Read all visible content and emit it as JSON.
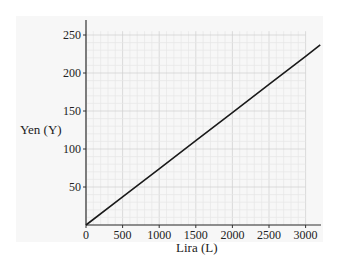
{
  "chart_data": {
    "type": "line",
    "title": "",
    "xlabel": "Lira (L)",
    "ylabel": "Yen (Y)",
    "xlim": [
      0,
      3200
    ],
    "ylim": [
      0,
      270
    ],
    "x_ticks": [
      0,
      500,
      1000,
      1500,
      2000,
      2500,
      3000
    ],
    "y_ticks": [
      50,
      100,
      150,
      200,
      250
    ],
    "grid": true,
    "minor_grid": {
      "x_step": 100,
      "y_step": 10
    },
    "legend": null,
    "series": [
      {
        "name": "Yen vs Lira",
        "color": "#1a1a1a",
        "x": [
          0,
          500,
          1000,
          1500,
          2000,
          2500,
          3000,
          3200
        ],
        "y": [
          0,
          37,
          74,
          111,
          148,
          185,
          222,
          237
        ]
      }
    ]
  },
  "labels": {
    "xlabel": "Lira (L)",
    "ylabel": "Yen (Y)",
    "x_ticks": [
      "0",
      "500",
      "1000",
      "1500",
      "2000",
      "2500",
      "3000"
    ],
    "y_ticks": [
      "50",
      "100",
      "150",
      "200",
      "250"
    ]
  },
  "colors": {
    "background": "#f7f7f7",
    "minor_grid": "#e6e6e6",
    "major_grid": "#cfcfcf",
    "axis": "#333333",
    "line": "#1a1a1a"
  }
}
